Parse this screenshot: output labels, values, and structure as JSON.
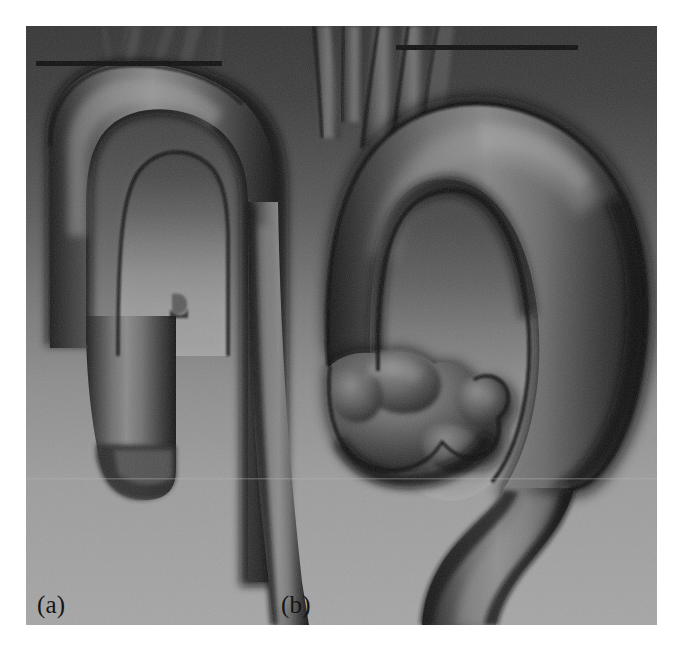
{
  "figure": {
    "kind": "medical-3d-volume-rendering",
    "modality_appearance": "grayscale CT/MR angiography surface rendering",
    "panel_count": 2,
    "canvas": {
      "width": 684,
      "height": 651,
      "background": "#ffffff"
    },
    "image_area": {
      "x": 26,
      "y": 26,
      "width": 631,
      "height": 599
    },
    "background": {
      "top_color": "#3a3a3a",
      "mid_color": "#6e6e6e",
      "bottom_color": "#a3a3a3",
      "description": "vertical gradient from dark grey at top to light grey at bottom"
    },
    "vessel": {
      "base_color": "#595959",
      "highlight_color": "#9b9b9b",
      "shadow_color": "#1b1b1b",
      "outline_color": "#121212"
    },
    "marker_lines": [
      {
        "name": "reference-line-a",
        "panel": "a",
        "x1": 36,
        "y1": 63,
        "x2": 222,
        "y2": 63,
        "thickness": 5,
        "color": "#111111"
      },
      {
        "name": "reference-line-b",
        "panel": "b",
        "x1": 396,
        "y1": 47,
        "x2": 578,
        "y2": 47,
        "thickness": 5,
        "color": "#111111"
      }
    ],
    "panels": [
      {
        "id": "a",
        "label": "(a)",
        "label_x": 37,
        "label_y": 592,
        "description": "narrow aortic arch with ascending aorta truncated, descending aorta running down right side"
      },
      {
        "id": "b",
        "label": "(b)",
        "label_x": 281,
        "label_y": 592,
        "description": "wide aortic arch with large saccular aneurysm on the ascending / proximal segment and supra-aortic branch vessels at top"
      }
    ]
  }
}
